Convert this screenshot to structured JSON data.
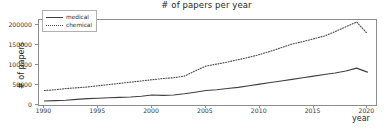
{
  "chart_data": {
    "type": "line",
    "title": "# of papers per year",
    "xlabel": "year",
    "ylabel": "# of papers",
    "xlim": [
      1989.5,
      2020.8
    ],
    "ylim": [
      0,
      212000
    ],
    "xticks": [
      1990,
      1995,
      2000,
      2005,
      2010,
      2015,
      2020
    ],
    "yticks": [
      0,
      50000,
      100000,
      150000,
      200000
    ],
    "ytick_labels": [
      "0",
      "50000",
      "100000",
      "150000",
      "200000"
    ],
    "xtick_labels": [
      "1990",
      "1995",
      "2000",
      "2005",
      "2010",
      "2015",
      "2020"
    ],
    "grid": false,
    "legend_position": "upper left",
    "x": [
      1990,
      1991,
      1992,
      1993,
      1994,
      1995,
      1996,
      1997,
      1998,
      1999,
      2000,
      2001,
      2002,
      2003,
      2004,
      2005,
      2006,
      2007,
      2008,
      2009,
      2010,
      2011,
      2012,
      2013,
      2014,
      2015,
      2016,
      2017,
      2018,
      2019,
      2020
    ],
    "series": [
      {
        "name": "medical",
        "style": "solid",
        "color": "#404040",
        "values": [
          10000,
          11000,
          12000,
          14000,
          16000,
          17000,
          18000,
          19000,
          20000,
          22000,
          25000,
          24000,
          25000,
          28000,
          32000,
          36000,
          38000,
          41000,
          44000,
          48000,
          52000,
          56000,
          60000,
          64000,
          68000,
          72000,
          76000,
          80000,
          85000,
          92000,
          82000
        ]
      },
      {
        "name": "chemical",
        "style": "dotted",
        "color": "#4a4a4a",
        "values": [
          36000,
          38000,
          41000,
          43000,
          45000,
          48000,
          51000,
          54000,
          57000,
          60000,
          63000,
          66000,
          68000,
          72000,
          85000,
          97000,
          102000,
          107000,
          113000,
          119000,
          126000,
          134000,
          143000,
          152000,
          158000,
          165000,
          172000,
          183000,
          195000,
          207000,
          178000
        ]
      }
    ]
  },
  "legend": {
    "items": [
      {
        "label": "medical"
      },
      {
        "label": "chemical"
      }
    ]
  },
  "caption": ""
}
